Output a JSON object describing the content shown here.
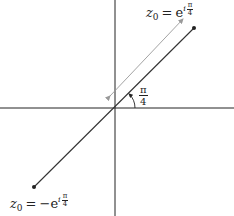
{
  "diagram": {
    "type": "complex-plane",
    "axes": {
      "horizontal": {
        "y": 108,
        "from": 0,
        "to": 234
      },
      "vertical": {
        "x": 115,
        "from": 0,
        "to": 216
      }
    },
    "points": [
      {
        "name": "z0-positive",
        "x": 194,
        "y": 28,
        "label": {
          "var": "z",
          "sub": "0",
          "eq": "=",
          "neg": "",
          "base": "e",
          "exp_i": "i",
          "exp_num": "π",
          "exp_den": "4"
        }
      },
      {
        "name": "z0-negative",
        "x": 34,
        "y": 187,
        "label": {
          "var": "z",
          "sub": "0",
          "eq": "=",
          "neg": "−",
          "base": "e",
          "exp_i": "i",
          "exp_num": "π",
          "exp_den": "4"
        }
      }
    ],
    "angle": {
      "num": "π",
      "den": "4"
    },
    "colors": {
      "axis": "#222222",
      "line": "#333333",
      "arrow": "#999999",
      "point": "#222222"
    }
  }
}
